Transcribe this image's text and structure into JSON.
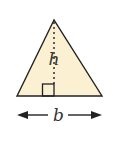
{
  "diagram": {
    "type": "triangle-area-figure",
    "labels": {
      "height": "h",
      "base": "b"
    },
    "colors": {
      "fill": "#fbf1d2",
      "stroke": "#222222"
    },
    "features": [
      "dotted-height-line",
      "right-angle-marker",
      "double-arrow-base"
    ]
  }
}
